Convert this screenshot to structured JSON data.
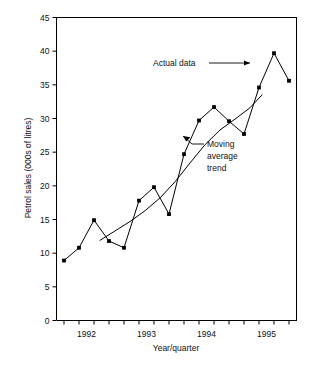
{
  "chart_data": {
    "type": "line",
    "title": "",
    "xlabel": "Year/quarter",
    "ylabel": "Petrol sales (000s of litres)",
    "ylim": [
      0,
      45
    ],
    "yticks": [
      0,
      5,
      10,
      15,
      20,
      25,
      30,
      35,
      40,
      45
    ],
    "ytick_labels": [
      "0",
      "5",
      "10",
      "15",
      "20",
      "25",
      "30",
      "35",
      "40",
      "45"
    ],
    "xtick_labels": [
      "1992",
      "1993",
      "1994",
      "1995"
    ],
    "xtick_label_positions": [
      1.5,
      5.5,
      9.5,
      13.5
    ],
    "x_total_ticks": 16,
    "grid": false,
    "legend_position": "none",
    "series": [
      {
        "name": "Actual data",
        "x": [
          0,
          1,
          2,
          3,
          4,
          5,
          6,
          7,
          8,
          9,
          10,
          11,
          12,
          13,
          14,
          15
        ],
        "values": [
          8.9,
          10.8,
          14.9,
          11.8,
          10.8,
          17.8,
          19.8,
          15.8,
          24.7,
          29.7,
          31.7,
          29.6,
          27.7,
          34.6,
          39.7,
          35.6
        ],
        "markers": true,
        "color": "#000000"
      },
      {
        "name": "Moving average trend",
        "x": [
          2.4,
          3.4,
          4.4,
          5.4,
          6.4,
          7.4,
          8.4,
          9.4,
          10.4,
          11.4,
          12.4,
          13.2
        ],
        "values": [
          11.9,
          13.3,
          14.7,
          16.3,
          18.2,
          20.6,
          23.4,
          26.1,
          28.3,
          29.9,
          31.6,
          33.5
        ],
        "markers": false,
        "color": "#000000"
      }
    ],
    "annotations": [
      {
        "id": "actual-data",
        "text": "Actual data",
        "lines": [
          "Actual data"
        ]
      },
      {
        "id": "moving-average-trend",
        "text": "Moving average trend",
        "lines": [
          "Moving",
          "average",
          "trend"
        ]
      }
    ]
  },
  "axes": {
    "y_title": "Petrol sales (000s of litres)",
    "x_title": "Year/quarter"
  }
}
